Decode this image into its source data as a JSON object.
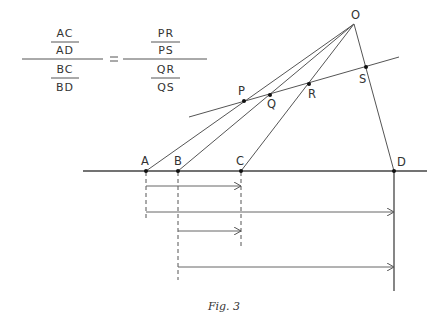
{
  "formula": {
    "left": {
      "top": {
        "numerator": "AC",
        "denominator": "AD"
      },
      "bottom": {
        "numerator": "BC",
        "denominator": "BD"
      }
    },
    "equals": "=",
    "right": {
      "top": {
        "numerator": "PR",
        "denominator": "PS"
      },
      "bottom": {
        "numerator": "QR",
        "denominator": "QS"
      }
    }
  },
  "points": {
    "O": {
      "label": "O",
      "x": 354,
      "y": 24
    },
    "P": {
      "label": "P",
      "x": 244,
      "y": 101
    },
    "Q": {
      "label": "Q",
      "x": 270,
      "y": 95
    },
    "R": {
      "label": "R",
      "x": 309,
      "y": 84
    },
    "S": {
      "label": "S",
      "x": 366,
      "y": 67
    },
    "A": {
      "label": "A",
      "x": 146,
      "y": 171
    },
    "B": {
      "label": "B",
      "x": 178,
      "y": 171
    },
    "C": {
      "label": "C",
      "x": 241,
      "y": 171
    },
    "D": {
      "label": "D",
      "x": 394,
      "y": 171
    }
  },
  "arrows": [
    {
      "name": "AC",
      "from": "A",
      "to": "C",
      "y": 186
    },
    {
      "name": "AD",
      "from": "A",
      "to": "D",
      "y": 212
    },
    {
      "name": "BC",
      "from": "B",
      "to": "C",
      "y": 231
    },
    {
      "name": "BD",
      "from": "B",
      "to": "D",
      "y": 267
    }
  ],
  "caption": "Fig. 3",
  "colors": {
    "line": "#555555",
    "dot": "#111111",
    "text": "#333333"
  }
}
